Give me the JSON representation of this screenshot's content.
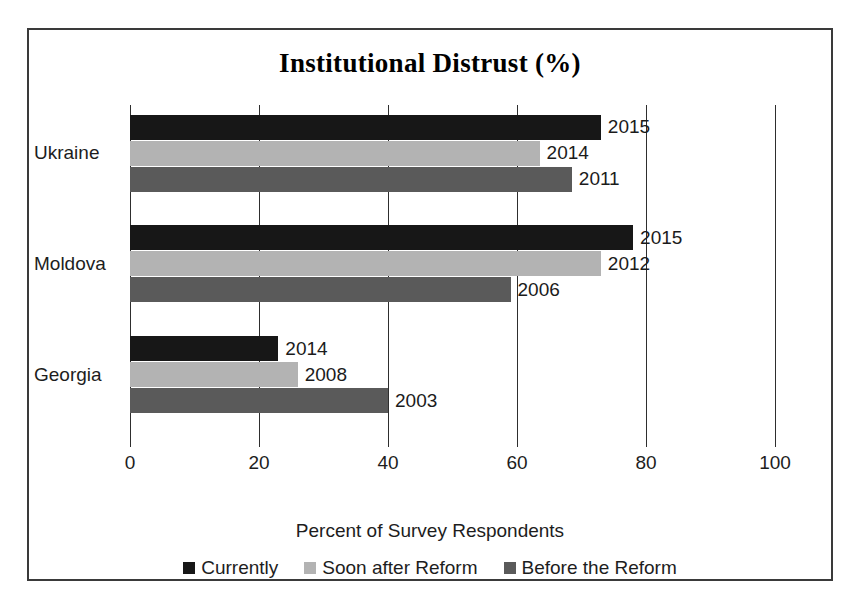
{
  "chart_data": {
    "type": "bar",
    "orientation": "horizontal",
    "title": "Institutional Distrust (%)",
    "xlabel": "Percent of Survey Respondents",
    "ylabel": "",
    "xlim": [
      0,
      100
    ],
    "xticks": [
      0,
      20,
      40,
      60,
      80,
      100
    ],
    "xtick_labels": [
      "0",
      "20",
      "40",
      "60",
      "80",
      "100"
    ],
    "grid": true,
    "grid_axis": "x",
    "legend_position": "bottom",
    "categories": [
      "Ukraine",
      "Moldova",
      "Georgia"
    ],
    "series": [
      {
        "name": "Currently",
        "color": "#171717",
        "values": [
          73,
          78,
          23
        ],
        "point_labels": [
          "2015",
          "2015",
          "2014"
        ]
      },
      {
        "name": "Soon after Reform",
        "color": "#b3b3b3",
        "values": [
          63.5,
          73,
          26
        ],
        "point_labels": [
          "2014",
          "2012",
          "2008"
        ]
      },
      {
        "name": "Before the Reform",
        "color": "#5a5a5a",
        "values": [
          68.5,
          59,
          40
        ],
        "point_labels": [
          "2011",
          "2006",
          "2003"
        ]
      }
    ]
  },
  "legend": {
    "items": [
      {
        "label": "Currently",
        "color": "#171717"
      },
      {
        "label": "Soon after Reform",
        "color": "#b3b3b3"
      },
      {
        "label": "Before the Reform",
        "color": "#5a5a5a"
      }
    ]
  },
  "colors": {
    "frame": "#3a3a3a",
    "axis": "#2e2e2e",
    "text": "#1d1d1d",
    "background": "#ffffff"
  }
}
